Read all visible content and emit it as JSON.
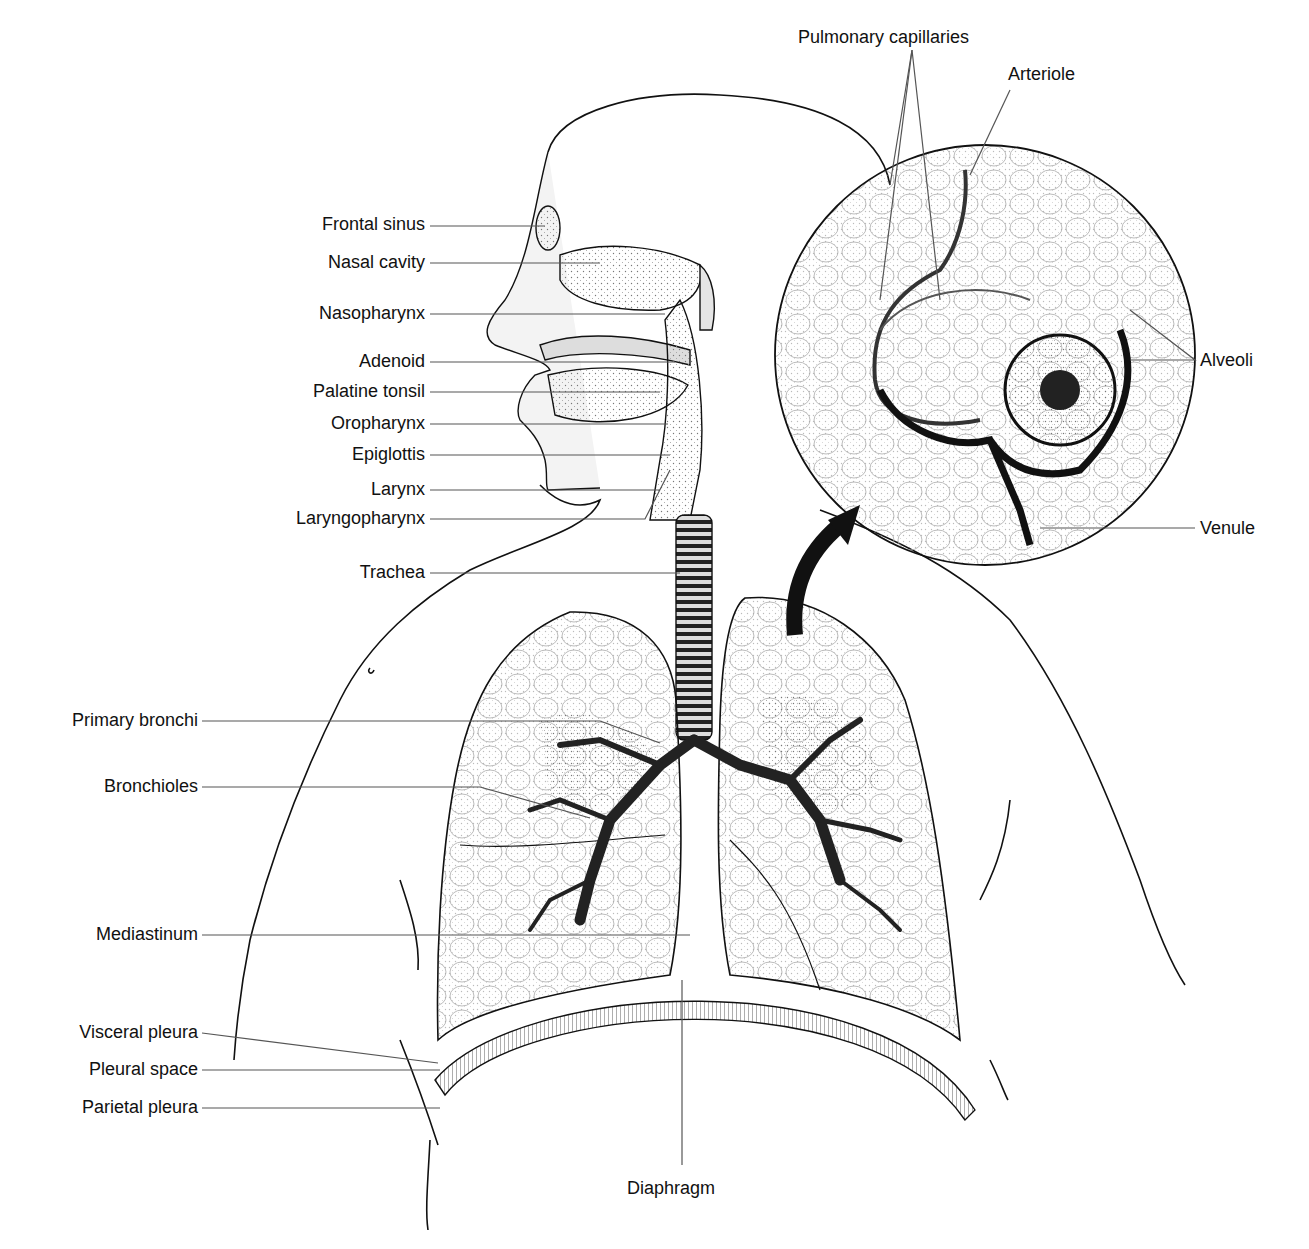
{
  "diagram": {
    "labels_left": [
      {
        "text": "Frontal sinus",
        "x": 425,
        "y": 226,
        "tx": 545,
        "ty": 226
      },
      {
        "text": "Nasal cavity",
        "x": 425,
        "y": 263,
        "tx": 600,
        "ty": 263
      },
      {
        "text": "Nasopharynx",
        "x": 425,
        "y": 314,
        "tx": 665,
        "ty": 314
      },
      {
        "text": "Adenoid",
        "x": 425,
        "y": 362,
        "tx": 675,
        "ty": 362
      },
      {
        "text": "Palatine tonsil",
        "x": 425,
        "y": 392,
        "tx": 660,
        "ty": 392
      },
      {
        "text": "Oropharynx",
        "x": 425,
        "y": 424,
        "tx": 668,
        "ty": 424
      },
      {
        "text": "Epiglottis",
        "x": 425,
        "y": 455,
        "tx": 670,
        "ty": 455
      },
      {
        "text": "Larynx",
        "x": 425,
        "y": 490,
        "tx": 660,
        "ty": 490
      },
      {
        "text": "Laryngopharynx",
        "x": 425,
        "y": 519,
        "tx": 640,
        "ty": 519
      },
      {
        "text": "Trachea",
        "x": 425,
        "y": 573,
        "tx": 680,
        "ty": 573
      },
      {
        "text": "Primary bronchi",
        "x": 198,
        "y": 721,
        "tx": 660,
        "ty": 743
      },
      {
        "text": "Bronchioles",
        "x": 198,
        "y": 787,
        "tx": 590,
        "ty": 818
      },
      {
        "text": "Mediastinum",
        "x": 198,
        "y": 935,
        "tx": 690,
        "ty": 935
      },
      {
        "text": "Visceral pleura",
        "x": 198,
        "y": 1033,
        "tx": 438,
        "ty": 1063
      },
      {
        "text": "Pleural space",
        "x": 198,
        "y": 1070,
        "tx": 440,
        "ty": 1070
      },
      {
        "text": "Parietal pleura",
        "x": 198,
        "y": 1108,
        "tx": 440,
        "ty": 1108
      }
    ],
    "labels_right": [
      {
        "text": "Pulmonary capillaries",
        "x": 798,
        "y": 27
      },
      {
        "text": "Arteriole",
        "x": 1008,
        "y": 64
      },
      {
        "text": "Alveoli",
        "x": 1200,
        "y": 350
      },
      {
        "text": "Venule",
        "x": 1200,
        "y": 518
      }
    ],
    "label_bottom": {
      "text": "Diaphragm",
      "x": 627,
      "y": 1178
    },
    "inset": {
      "cx": 985,
      "cy": 355,
      "r": 210,
      "caption": "Alveoli enlarged view"
    },
    "colors": {
      "ink": "#111111",
      "leader": "#555555",
      "stipple": "#9a9a9a",
      "background": "#ffffff"
    }
  }
}
